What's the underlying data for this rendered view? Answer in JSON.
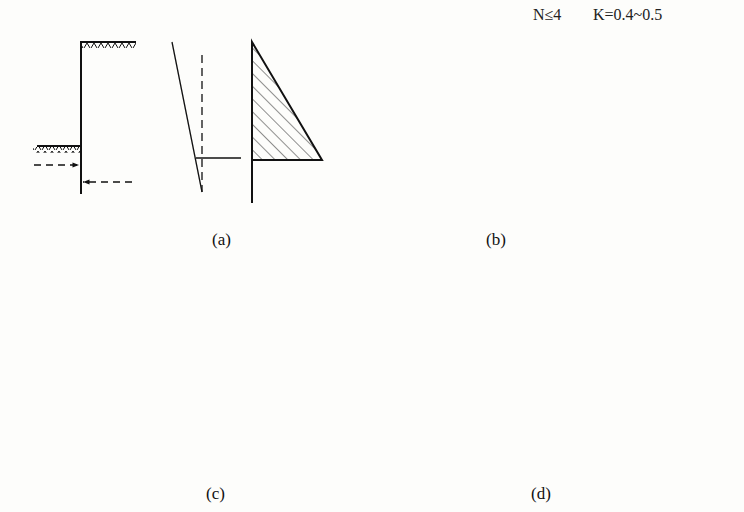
{
  "header": {
    "condition_n": "N≤4",
    "condition_k": "K=0.4~0.5"
  },
  "panels": [
    {
      "id": "a",
      "label": "(a)",
      "description": "Cantilever retaining wall: linear deflection, triangular earth pressure distribution"
    },
    {
      "id": "b",
      "label": "(b)",
      "description": "Single top support: curved deflection, bulging pressure distribution"
    },
    {
      "id": "c",
      "label": "(c)",
      "description": "Top support with rotation: kinked deflection, arched pressure vs dashed triangular"
    },
    {
      "id": "d",
      "label": "(d)",
      "description": "Multiple supports: parallel translation, rounded pressure vs dashed triangular"
    }
  ],
  "colors": {
    "line": "#111111",
    "background": "#fdfdfb",
    "hatch": "#222222"
  }
}
